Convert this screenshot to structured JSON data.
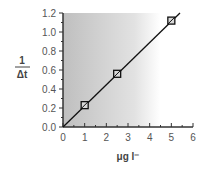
{
  "chart_data": {
    "type": "scatter",
    "title": "",
    "xlabel": "μg l⁻",
    "ylabel_numerator": "1",
    "ylabel_denominator": "Δt",
    "xlim": [
      0,
      6
    ],
    "ylim": [
      0,
      1.2
    ],
    "x_ticks": [
      "0",
      "1",
      "2",
      "3",
      "4",
      "5",
      "6"
    ],
    "y_ticks": [
      "0.0",
      "0.2",
      "0.4",
      "0.6",
      "0.8",
      "1.0",
      "1.2"
    ],
    "grid": false,
    "series": [
      {
        "name": "measurements",
        "marker": "square",
        "x": [
          1,
          2.5,
          5
        ],
        "y": [
          0.23,
          0.56,
          1.12
        ]
      },
      {
        "name": "linear fit",
        "type": "line",
        "x": [
          0,
          5.4
        ],
        "y": [
          0,
          1.2
        ]
      }
    ],
    "background": "gradient gray (left) to white (right)"
  }
}
